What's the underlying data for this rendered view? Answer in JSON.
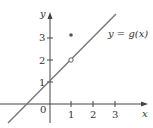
{
  "diagram": {
    "function_label": "y = g(x)",
    "axes": {
      "x_label": "x",
      "y_label": "y",
      "origin_label": "0",
      "x_ticks": [
        "1",
        "2",
        "3"
      ],
      "y_ticks": [
        "1",
        "2",
        "3"
      ]
    },
    "line": {
      "slope": 1,
      "intercept": 1,
      "color": "#777777"
    },
    "points": [
      {
        "x": 1,
        "y": 3,
        "type": "filled"
      },
      {
        "x": 1,
        "y": 2,
        "type": "open"
      }
    ]
  }
}
